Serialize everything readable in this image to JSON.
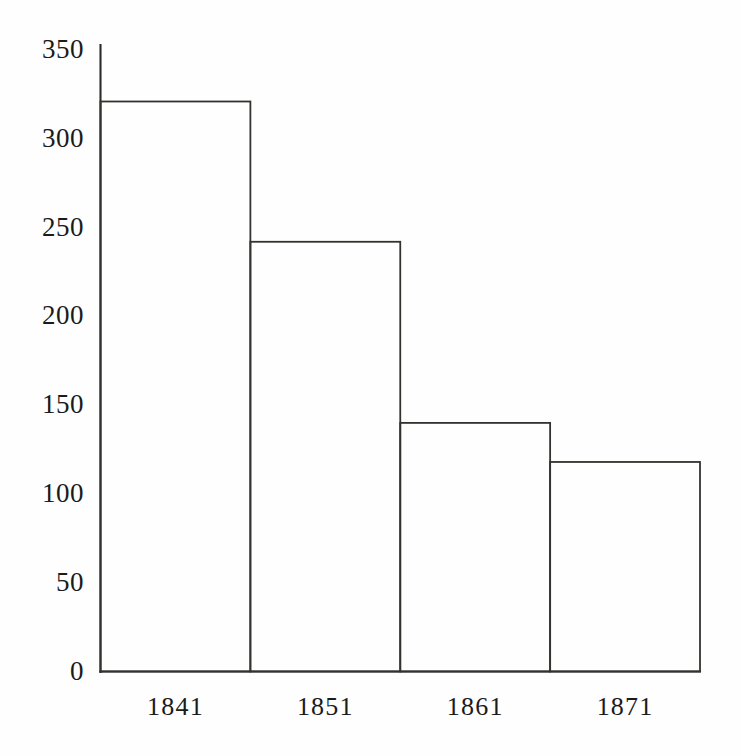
{
  "chart_data": {
    "type": "bar",
    "title": "",
    "subtitle": "",
    "xlabel": "",
    "ylabel": "",
    "categories": [
      "1841",
      "1851",
      "1861",
      "1871"
    ],
    "values": [
      321,
      242,
      140,
      118
    ],
    "ylim": [
      0,
      350
    ],
    "ytick_labels": [
      "350",
      "300",
      "250",
      "200",
      "150",
      "100",
      "50",
      "0"
    ],
    "ytick_values": [
      350,
      300,
      250,
      200,
      150,
      100,
      50,
      0
    ],
    "grid": false,
    "legend": null,
    "annotations": [],
    "series": [
      {
        "name": "",
        "values": [
          321,
          242,
          140,
          118
        ]
      }
    ],
    "style": {
      "bar_fill": "none",
      "bar_stroke": "#33322f",
      "axis_stroke": "#2b2b2b",
      "background": "#fefefe",
      "text_color": "#1b1b1b"
    }
  },
  "figure": {
    "caption": ""
  }
}
